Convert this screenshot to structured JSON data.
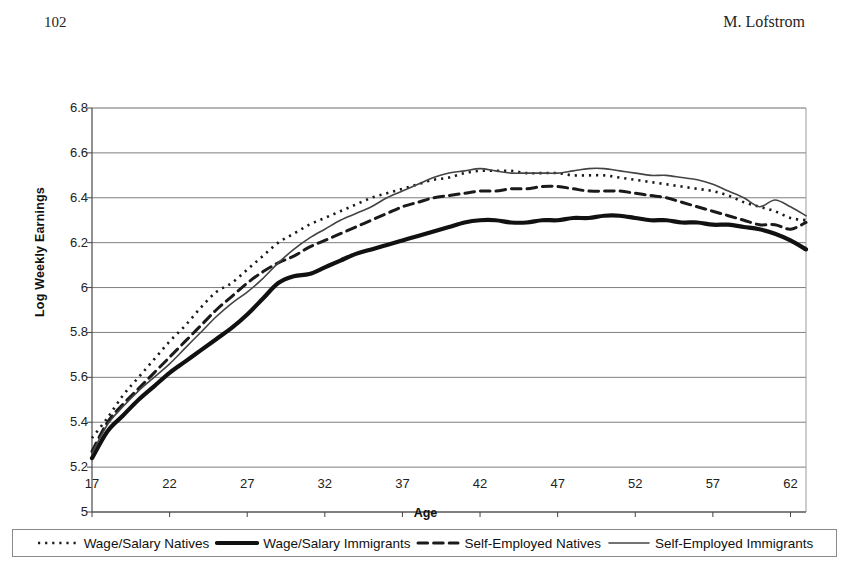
{
  "page": {
    "folio": "102",
    "running_head": "M. Lofstrom"
  },
  "chart_data": {
    "type": "line",
    "title": "",
    "xlabel": "Age",
    "ylabel": "Log Weekly Earnings",
    "xlim": [
      17,
      63
    ],
    "ylim": [
      5,
      6.8
    ],
    "grid": "horizontal",
    "legend_position": "bottom",
    "xticks": [
      17,
      22,
      27,
      32,
      37,
      42,
      47,
      52,
      57,
      62
    ],
    "yticks": [
      "5",
      "5.2",
      "5.4",
      "5.6",
      "5.8",
      "6",
      "6.2",
      "6.4",
      "6.6",
      "6.8"
    ],
    "x": [
      17,
      18,
      19,
      20,
      21,
      22,
      23,
      24,
      25,
      26,
      27,
      28,
      29,
      30,
      31,
      32,
      33,
      34,
      35,
      36,
      37,
      38,
      39,
      40,
      41,
      42,
      43,
      44,
      45,
      46,
      47,
      48,
      49,
      50,
      51,
      52,
      53,
      54,
      55,
      56,
      57,
      58,
      59,
      60,
      61,
      62,
      63
    ],
    "series": [
      {
        "name": "Wage/Salary Natives",
        "style": "dotted",
        "color": "#1a1a1a",
        "width": 2.6,
        "values": [
          5.33,
          5.42,
          5.52,
          5.6,
          5.68,
          5.76,
          5.83,
          5.91,
          5.98,
          6.02,
          6.08,
          6.14,
          6.2,
          6.24,
          6.28,
          6.31,
          6.34,
          6.37,
          6.4,
          6.42,
          6.44,
          6.46,
          6.48,
          6.49,
          6.51,
          6.52,
          6.52,
          6.52,
          6.51,
          6.51,
          6.51,
          6.5,
          6.5,
          6.5,
          6.49,
          6.48,
          6.47,
          6.46,
          6.45,
          6.44,
          6.43,
          6.41,
          6.38,
          6.36,
          6.34,
          6.31,
          6.3
        ]
      },
      {
        "name": "Wage/Salary Immigrants",
        "style": "solid",
        "color": "#111111",
        "width": 4.2,
        "values": [
          5.24,
          5.36,
          5.43,
          5.5,
          5.56,
          5.62,
          5.67,
          5.72,
          5.77,
          5.82,
          5.88,
          5.95,
          6.02,
          6.05,
          6.06,
          6.09,
          6.12,
          6.15,
          6.17,
          6.19,
          6.21,
          6.23,
          6.25,
          6.27,
          6.29,
          6.3,
          6.3,
          6.29,
          6.29,
          6.3,
          6.3,
          6.31,
          6.31,
          6.32,
          6.32,
          6.31,
          6.3,
          6.3,
          6.29,
          6.29,
          6.28,
          6.28,
          6.27,
          6.26,
          6.24,
          6.21,
          6.17
        ]
      },
      {
        "name": "Self-Employed Natives",
        "style": "dashed",
        "color": "#1a1a1a",
        "width": 3.0,
        "values": [
          5.27,
          5.4,
          5.48,
          5.55,
          5.62,
          5.69,
          5.76,
          5.83,
          5.9,
          5.96,
          6.02,
          6.07,
          6.11,
          6.14,
          6.18,
          6.21,
          6.24,
          6.27,
          6.3,
          6.33,
          6.36,
          6.38,
          6.4,
          6.41,
          6.42,
          6.43,
          6.43,
          6.44,
          6.44,
          6.45,
          6.45,
          6.44,
          6.43,
          6.43,
          6.43,
          6.42,
          6.41,
          6.4,
          6.38,
          6.36,
          6.34,
          6.32,
          6.3,
          6.28,
          6.28,
          6.26,
          6.29
        ]
      },
      {
        "name": "Self-Employed Immigrants",
        "style": "solid-thin",
        "color": "#444444",
        "width": 1.6,
        "values": [
          5.26,
          5.39,
          5.47,
          5.54,
          5.6,
          5.66,
          5.73,
          5.8,
          5.87,
          5.93,
          5.98,
          6.04,
          6.11,
          6.17,
          6.22,
          6.26,
          6.3,
          6.33,
          6.36,
          6.4,
          6.43,
          6.46,
          6.49,
          6.51,
          6.52,
          6.53,
          6.52,
          6.51,
          6.51,
          6.51,
          6.51,
          6.52,
          6.53,
          6.53,
          6.52,
          6.51,
          6.5,
          6.5,
          6.49,
          6.48,
          6.46,
          6.43,
          6.4,
          6.36,
          6.39,
          6.36,
          6.32
        ]
      }
    ]
  },
  "legend": {
    "items": [
      {
        "label": "Wage/Salary Natives",
        "style": "dotted"
      },
      {
        "label": "Wage/Salary Immigrants",
        "style": "solid"
      },
      {
        "label": "Self-Employed Natives",
        "style": "dashed"
      },
      {
        "label": "Self-Employed Immigrants",
        "style": "solid-thin"
      }
    ]
  }
}
